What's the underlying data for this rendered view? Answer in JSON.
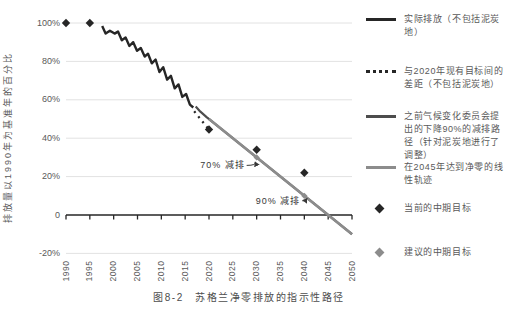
{
  "figure": {
    "caption": "图8-2　苏格兰净零排放的指示性路径",
    "y_axis_label": "排放量以1990年为基准年的百分比"
  },
  "colors": {
    "actual_line": "#262626",
    "gap_dotted": "#262626",
    "ccc_path": "#4d4d4d",
    "netzero_line": "#8c8c8c",
    "grid": "#e2e2e2",
    "axis": "#262626",
    "tick_text": "#595959",
    "annotation_text": "#383838",
    "current_target": "#262626",
    "proposed_target": "#8c8c8c"
  },
  "chart_data": {
    "type": "line",
    "title": "图8-2　苏格兰净零排放的指示性路径",
    "xlabel": "",
    "ylabel": "排放量以1990年为基准年的百分比",
    "xlim": [
      1990,
      2050
    ],
    "ylim": [
      -20,
      100
    ],
    "grid": "horizontal-only",
    "legend_position": "right",
    "x_ticks": [
      1990,
      1995,
      2000,
      2005,
      2010,
      2015,
      2020,
      2025,
      2030,
      2035,
      2040,
      2045,
      2050
    ],
    "y_ticks": [
      {
        "value": 100,
        "label": "100%"
      },
      {
        "value": 80,
        "label": "80%"
      },
      {
        "value": 60,
        "label": "60%"
      },
      {
        "value": 40,
        "label": "40%"
      },
      {
        "value": 20,
        "label": "20%"
      },
      {
        "value": 0,
        "label": "0"
      },
      {
        "value": -20,
        "label": "-20%"
      }
    ],
    "series": [
      {
        "name": "实际排放（不包括泥炭地）",
        "style": "solid",
        "color_key": "actual_line",
        "points": [
          [
            1997.6,
            98.5
          ],
          [
            1998.3,
            94.5
          ],
          [
            1999.2,
            96
          ],
          [
            2000.2,
            94.5
          ],
          [
            2000.9,
            95.5
          ],
          [
            2001.7,
            91
          ],
          [
            2002.5,
            92.5
          ],
          [
            2003.3,
            88
          ],
          [
            2004.1,
            90
          ],
          [
            2004.9,
            85.5
          ],
          [
            2005.7,
            87
          ],
          [
            2006.5,
            82.5
          ],
          [
            2007.2,
            84
          ],
          [
            2008,
            79
          ],
          [
            2008.8,
            81
          ],
          [
            2009.6,
            74.5
          ],
          [
            2010.4,
            77
          ],
          [
            2011.2,
            70.5
          ],
          [
            2012,
            72.5
          ],
          [
            2012.8,
            66
          ],
          [
            2013.6,
            68
          ],
          [
            2014.4,
            61.5
          ],
          [
            2015.2,
            63
          ],
          [
            2016,
            57.5
          ],
          [
            2016.7,
            56
          ]
        ]
      },
      {
        "name": "与2020年现有目标间的差距（不包括泥炭地）",
        "style": "dotted",
        "color_key": "gap_dotted",
        "points": [
          [
            2016.9,
            54
          ],
          [
            2020,
            44.5
          ]
        ]
      },
      {
        "name": "之前气候变化委员会提出的下降90%的减排路径（针对泥炭地进行了调整）",
        "style": "solid",
        "color_key": "ccc_path",
        "points": [
          [
            2017.2,
            56.5
          ],
          [
            2018.2,
            53.8
          ],
          [
            2019.5,
            51
          ],
          [
            2050,
            -10
          ]
        ]
      },
      {
        "name": "在2045年达到净零的线性轨迹",
        "style": "solid",
        "color_key": "netzero_line",
        "points": [
          [
            2020,
            50
          ],
          [
            2045,
            0
          ],
          [
            2050,
            -10
          ]
        ]
      }
    ],
    "markers": [
      {
        "name": "当前的中期目标",
        "shape": "diamond",
        "color_key": "current_target",
        "points": [
          [
            1990,
            100
          ],
          [
            1995,
            100
          ],
          [
            2020,
            44.5
          ],
          [
            2030,
            34
          ],
          [
            2040,
            22
          ]
        ]
      },
      {
        "name": "建议的中期目标",
        "shape": "diamond",
        "color_key": "proposed_target",
        "points": [
          [
            2030,
            30
          ],
          [
            2040,
            10
          ]
        ]
      }
    ],
    "annotations": [
      {
        "text": "70% 减排",
        "year": 2030,
        "pct": 30
      },
      {
        "text": "90% 减排",
        "year": 2040,
        "pct": 10
      }
    ]
  },
  "legend": {
    "items": [
      {
        "label": "实际排放（不包括泥炭地）",
        "swatch": "line-thick"
      },
      {
        "label": "与2020年现有目标间的差距（不包括泥炭地）",
        "swatch": "dotted"
      },
      {
        "label": "之前气候变化委员会提出的下降90%的减排路径（针对泥炭地进行了调整）",
        "swatch": "line-dark"
      },
      {
        "label": "在2045年达到净零的线性轨迹",
        "swatch": "line-gray"
      },
      {
        "label": "当前的中期目标",
        "swatch": "diamond-dark"
      },
      {
        "label": "建议的中期目标",
        "swatch": "diamond-gray"
      }
    ]
  }
}
